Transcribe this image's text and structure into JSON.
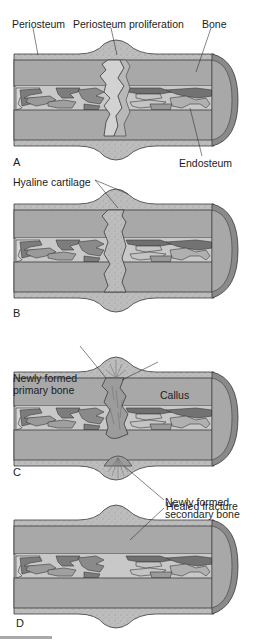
{
  "figure": {
    "colors": {
      "cortex": "#a8a8a8",
      "periosteum": "#b9b9b9",
      "marrow_light": "#c4c4c4",
      "trabecula_dark": "#7a7a7a",
      "trabecula_mid": "#999999",
      "callus": "#bdbdbd",
      "cap_dark": "#8a8a8a",
      "outline": "#3a3a3a"
    },
    "panels": [
      {
        "letter": "A",
        "labels": {
          "periosteum": "Periosteum",
          "proliferation": "Periosteum proliferation",
          "bone": "Bone",
          "endosteum": "Endosteum"
        }
      },
      {
        "letter": "B",
        "labels": {
          "hyaline": "Hyaline cartilage"
        }
      },
      {
        "letter": "C",
        "labels": {
          "primary_line1": "Newly formed",
          "primary_line2": "primary bone",
          "callus": "Callus",
          "secondary_line1": "Newly formed",
          "secondary_line2": "secondary bone"
        }
      },
      {
        "letter": "D",
        "labels": {
          "healed": "Healed fracture"
        }
      }
    ]
  }
}
